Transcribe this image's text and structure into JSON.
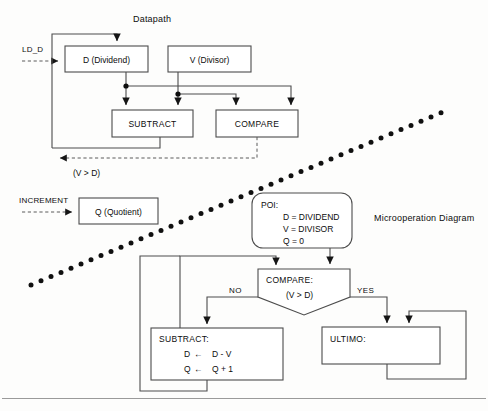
{
  "figure": {
    "datapath_title": "Datapath",
    "microop_title": "Microoperation Diagram"
  },
  "datapath": {
    "signals": [
      {
        "name": "ld-d",
        "label": "LD_D"
      },
      {
        "name": "increment",
        "label": "INCREMENT"
      }
    ],
    "registers": [
      {
        "name": "d-register",
        "label": "D (Dividend)"
      },
      {
        "name": "v-register",
        "label": "V (Divisor)"
      },
      {
        "name": "q-register",
        "label": "Q (Quotient)"
      }
    ],
    "units": [
      {
        "name": "subtract-unit",
        "label": "SUBTRACT"
      },
      {
        "name": "compare-unit",
        "label": "COMPARE"
      }
    ],
    "status_condition": "(V > D)"
  },
  "flowchart": {
    "poi": {
      "header": "POI:",
      "lines": [
        "D  =  DIVIDEND",
        "V  =  DIVISOR",
        "Q  =  0"
      ]
    },
    "decision": {
      "header": "COMPARE:",
      "condition": "(V > D)",
      "branch_no": "NO",
      "branch_yes": "YES"
    },
    "subtract_state": {
      "header": "SUBTRACT:",
      "lines": [
        {
          "lhs": "D",
          "arrow": "←",
          "rhs": "D - V"
        },
        {
          "lhs": "Q",
          "arrow": "←",
          "rhs": "Q + 1"
        }
      ]
    },
    "ultimo_state": {
      "header": "ULTIMO:"
    }
  },
  "colors": {
    "ink": "#0d0d0d",
    "line": "#4c4c4c",
    "dashed": "#5a5a5a",
    "paper": "#fdfdfc"
  }
}
